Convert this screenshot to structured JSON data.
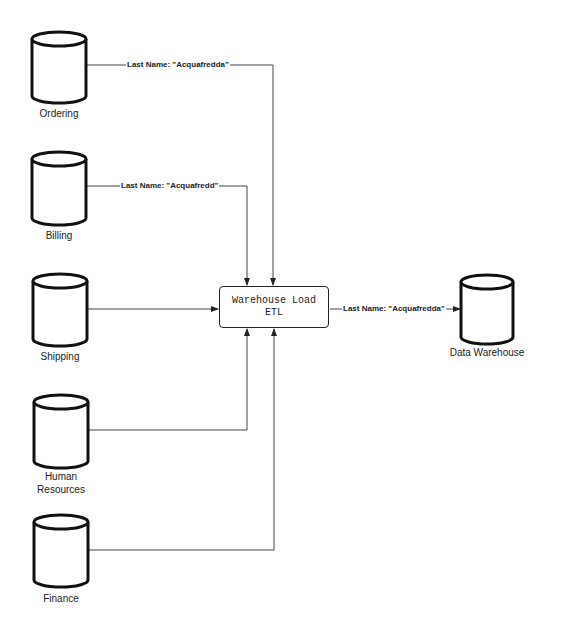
{
  "diagram": {
    "type": "data-flow",
    "sources": [
      {
        "id": "ordering",
        "label_lines": [
          "Ordering"
        ],
        "edge_label": "Last Name: \"Acquafredda\""
      },
      {
        "id": "billing",
        "label_lines": [
          "Billing"
        ],
        "edge_label": "Last Name: \"Acquafredd\""
      },
      {
        "id": "shipping",
        "label_lines": [
          "Shipping"
        ],
        "edge_label": ""
      },
      {
        "id": "human-resources",
        "label_lines": [
          "Human",
          "Resources"
        ],
        "edge_label": ""
      },
      {
        "id": "finance",
        "label_lines": [
          "Finance"
        ],
        "edge_label": ""
      }
    ],
    "process": {
      "id": "warehouse-load-etl",
      "label_lines": [
        "Warehouse Load",
        "ETL"
      ]
    },
    "target": {
      "id": "data-warehouse",
      "label_lines": [
        "Data Warehouse"
      ],
      "edge_label": "Last Name: \"Acquafredda\""
    },
    "colors": {
      "stroke": "#222222",
      "line": "#444444",
      "background": "#ffffff"
    }
  }
}
